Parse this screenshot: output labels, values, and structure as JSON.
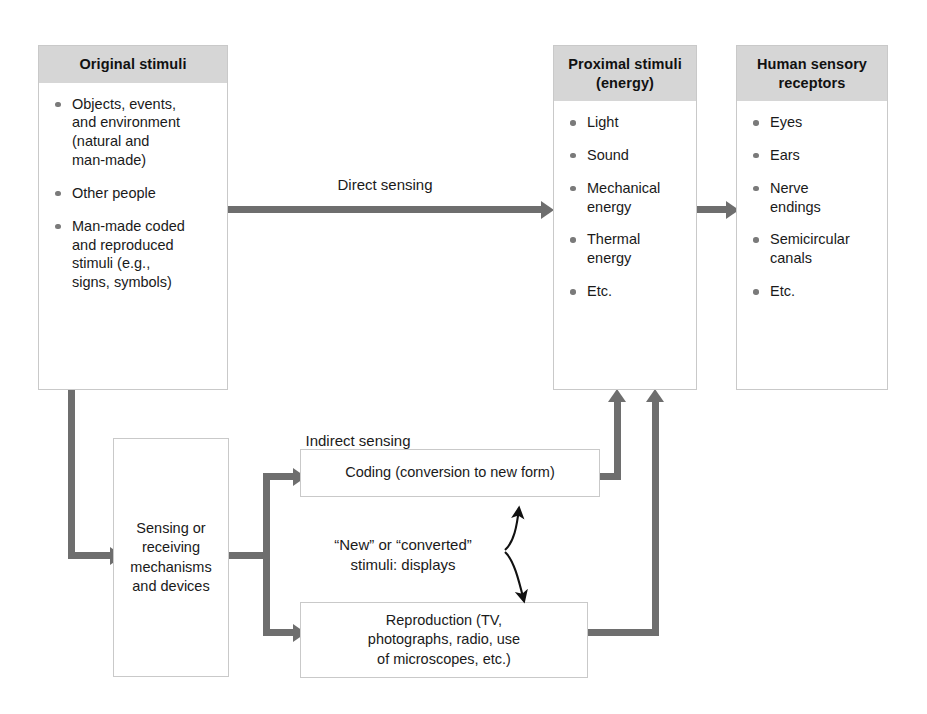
{
  "diagram": {
    "title_hidden": "",
    "colors": {
      "header_band": "#d6d6d6",
      "connector": "#6e6e6e",
      "box_border": "#c9c9c9",
      "bullet": "#7a7a7a",
      "background": "#ffffff",
      "text": "#1a1a1a"
    },
    "boxes": {
      "original_stimuli": {
        "header": "Original stimuli",
        "items": [
          "Objects, events,\nand environment\n(natural and\nman-made)",
          "Other people",
          "Man-made coded\nand reproduced\nstimuli (e.g.,\nsigns, symbols)"
        ]
      },
      "proximal_stimuli": {
        "header": "Proximal stimuli\n(energy)",
        "items": [
          "Light",
          "Sound",
          "Mechanical\nenergy",
          "Thermal\nenergy",
          "Etc."
        ]
      },
      "human_sensory_receptors": {
        "header": "Human sensory\nreceptors",
        "items": [
          "Eyes",
          "Ears",
          "Nerve\nendings",
          "Semicircular\ncanals",
          "Etc."
        ]
      },
      "sensing_devices": {
        "text": "Sensing or\nreceiving\nmechanisms\nand devices"
      },
      "coding": {
        "text": "Coding (conversion to new form)"
      },
      "reproduction": {
        "text": "Reproduction (TV,\nphotographs, radio, use\nof microscopes, etc.)"
      }
    },
    "labels": {
      "direct_sensing": "Direct sensing",
      "indirect_sensing": "Indirect sensing",
      "new_converted": "“New” or “converted”\nstimuli: displays"
    }
  }
}
